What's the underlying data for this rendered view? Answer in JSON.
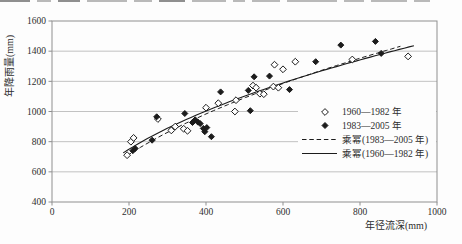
{
  "figure": {
    "background": "#fdfdfd",
    "ink": "#1c1c1c",
    "grid_color": "#b3b3b3",
    "border_color": "#8f8f8f",
    "tick_label_color": "#3a3a3a"
  },
  "chart_data": {
    "type": "scatter",
    "title": "",
    "xlabel": "年径流深(mm)",
    "ylabel": "年降雨量(mm)",
    "xlim": [
      0,
      1000
    ],
    "ylim": [
      400,
      1600
    ],
    "x_ticks": [
      0,
      200,
      400,
      600,
      800,
      1000
    ],
    "y_ticks": [
      400,
      600,
      800,
      1000,
      1200,
      1400,
      1600
    ],
    "grid": "horizontal-only",
    "legend_position": "inside-right-middle",
    "series": [
      {
        "name": "1960—1982 年",
        "marker": "open-diamond",
        "points": [
          [
            195,
            710
          ],
          [
            205,
            800
          ],
          [
            212,
            825
          ],
          [
            275,
            950
          ],
          [
            310,
            875
          ],
          [
            320,
            900
          ],
          [
            342,
            885
          ],
          [
            352,
            872
          ],
          [
            400,
            1025
          ],
          [
            432,
            1055
          ],
          [
            475,
            1000
          ],
          [
            478,
            1075
          ],
          [
            522,
            1172
          ],
          [
            530,
            1158
          ],
          [
            540,
            1118
          ],
          [
            550,
            1115
          ],
          [
            575,
            1165
          ],
          [
            588,
            1158
          ],
          [
            578,
            1310
          ],
          [
            600,
            1280
          ],
          [
            632,
            1330
          ],
          [
            780,
            1345
          ],
          [
            925,
            1365
          ]
        ]
      },
      {
        "name": "1983—2005 年",
        "marker": "filled-diamond",
        "points": [
          [
            210,
            740
          ],
          [
            216,
            755
          ],
          [
            260,
            810
          ],
          [
            272,
            965
          ],
          [
            345,
            987
          ],
          [
            365,
            927
          ],
          [
            372,
            945
          ],
          [
            379,
            930
          ],
          [
            385,
            920
          ],
          [
            393,
            888
          ],
          [
            402,
            893
          ],
          [
            397,
            866
          ],
          [
            414,
            833
          ],
          [
            438,
            1130
          ],
          [
            510,
            1140
          ],
          [
            515,
            1005
          ],
          [
            525,
            1230
          ],
          [
            565,
            1235
          ],
          [
            617,
            1145
          ],
          [
            685,
            1330
          ],
          [
            750,
            1440
          ],
          [
            840,
            1465
          ],
          [
            855,
            1385
          ]
        ]
      }
    ],
    "trendlines": [
      {
        "name": "乘幂(1983—2005 年)",
        "style": "dashed",
        "power_a": 62.5,
        "power_b": 0.46,
        "x_range": [
          195,
          905
        ]
      },
      {
        "name": "乘幂(1960—1982 年)",
        "style": "solid",
        "power_a": 81.0,
        "power_b": 0.42,
        "x_range": [
          185,
          940
        ]
      }
    ],
    "legend": [
      {
        "symbol": "open-diamond",
        "label": "1960—1982 年"
      },
      {
        "symbol": "filled-diamond",
        "label": "1983—2005 年"
      },
      {
        "symbol": "dashed-line",
        "label": "乘幂(1983—2005 年)"
      },
      {
        "symbol": "solid-line",
        "label": "乘幂(1960—1982 年)"
      }
    ]
  }
}
